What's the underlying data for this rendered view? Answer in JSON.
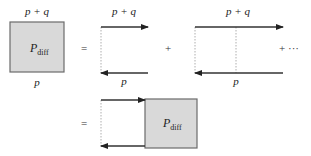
{
  "diagram": {
    "row1": {
      "box": {
        "label_main": "P",
        "label_sub": "diff",
        "top_label": "p + q",
        "bottom_label": "p",
        "fill": "#d9d9d9"
      },
      "equals": "=",
      "term1": {
        "top_label": "p + q",
        "bottom_label": "p"
      },
      "plus": "+",
      "term2": {
        "top_label": "p + q",
        "bottom_label": "p"
      },
      "plus_ellipsis": "+ ···"
    },
    "row2": {
      "equals": "=",
      "box": {
        "label_main": "P",
        "label_sub": "diff",
        "fill": "#d9d9d9"
      }
    },
    "colors": {
      "line": "#333333",
      "dashed": "#9a9a9a",
      "box_border": "#6b6b6b",
      "box_fill": "#d9d9d9"
    }
  }
}
